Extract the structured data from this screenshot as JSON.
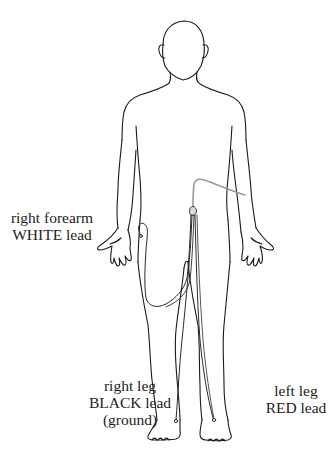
{
  "diagram": {
    "colors": {
      "outline": "#1a1a1a",
      "lead_wire": "#333333",
      "cable": "#999999",
      "text": "#222222",
      "background": "#ffffff"
    },
    "labels": {
      "right_forearm": {
        "line1": "right forearm",
        "line2": "WHITE lead"
      },
      "right_leg": {
        "line1": "right leg",
        "line2": "BLACK lead",
        "line3": "(ground)"
      },
      "left_leg": {
        "line1": "left leg",
        "line2": "RED lead"
      }
    }
  }
}
